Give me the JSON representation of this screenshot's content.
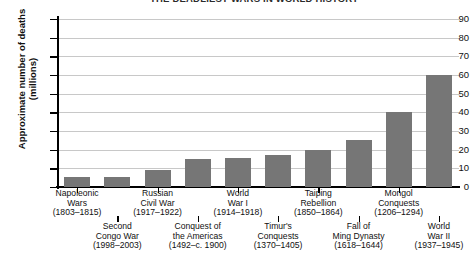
{
  "title": "THE DEADLIEST WARS IN WORLD HISTORY",
  "axis": {
    "y_title_line1": "Approximate number of deaths",
    "y_title_line2": "(millions)",
    "y_ticks": [
      "0",
      "10",
      "20",
      "30",
      "40",
      "50",
      "60",
      "70",
      "80",
      "90"
    ]
  },
  "colors": {
    "bar": "#767676",
    "grid": "#c8c8c8",
    "axis": "#000000",
    "background": "#ffffff"
  },
  "chart_data": {
    "type": "bar",
    "title": "THE DEADLIEST WARS IN WORLD HISTORY",
    "xlabel": "",
    "ylabel": "Approximate number of deaths (millions)",
    "ylim": [
      0,
      95
    ],
    "ytick_step": 10,
    "grid": true,
    "legend": "none",
    "categories": [
      "Napoleonic Wars (1803–1815)",
      "Second Congo War (1998–2003)",
      "Russian Civil War (1917–1922)",
      "Conquest of the Americas (1492–c. 1900)",
      "World War I (1914–1918)",
      "Timur's Conquests (1370–1405)",
      "Taiping Rebellion (1850–1864)",
      "Fall of Ming Dynasty (1618–1644)",
      "Mongol Conquests (1206–1294)",
      "World War II (1937–1945)"
    ],
    "values": [
      5.5,
      5.5,
      9,
      15,
      15.5,
      17,
      20,
      25,
      40,
      60
    ],
    "bars": [
      {
        "name_line1": "Napoleonic",
        "name_line2": "Wars",
        "years": "(1803–1815)",
        "value": 5.5,
        "row": "top"
      },
      {
        "name_line1": "Second",
        "name_line2": "Congo War",
        "years": "(1998–2003)",
        "value": 5.5,
        "row": "bottom"
      },
      {
        "name_line1": "Russian",
        "name_line2": "Civil War",
        "years": "(1917–1922)",
        "value": 9,
        "row": "top"
      },
      {
        "name_line1": "Conquest of",
        "name_line2": "the Americas",
        "years": "(1492–c. 1900)",
        "value": 15,
        "row": "bottom"
      },
      {
        "name_line1": "World",
        "name_line2": "War I",
        "years": "(1914–1918)",
        "value": 15.5,
        "row": "top"
      },
      {
        "name_line1": "Timur's",
        "name_line2": "Conquests",
        "years": "(1370–1405)",
        "value": 17,
        "row": "bottom"
      },
      {
        "name_line1": "Taiping",
        "name_line2": "Rebellion",
        "years": "(1850–1864)",
        "value": 20,
        "row": "top"
      },
      {
        "name_line1": "Fall of",
        "name_line2": "Ming Dynasty",
        "years": "(1618–1644)",
        "value": 25,
        "row": "bottom"
      },
      {
        "name_line1": "Mongol",
        "name_line2": "Conquests",
        "years": "(1206–1294)",
        "value": 40,
        "row": "top"
      },
      {
        "name_line1": "World",
        "name_line2": "War II",
        "years": "(1937–1945)",
        "value": 60,
        "row": "bottom"
      }
    ]
  }
}
